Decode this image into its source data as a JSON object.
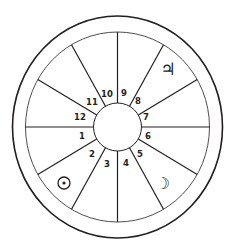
{
  "diagram": {
    "type": "astrological-house-wheel",
    "house_count": 12,
    "colors": {
      "stroke": "#231f20",
      "background": "#ffffff"
    },
    "houses": [
      {
        "number": "1",
        "label": "1"
      },
      {
        "number": "2",
        "label": "2"
      },
      {
        "number": "3",
        "label": "3"
      },
      {
        "number": "4",
        "label": "4"
      },
      {
        "number": "5",
        "label": "5"
      },
      {
        "number": "6",
        "label": "6"
      },
      {
        "number": "7",
        "label": "7"
      },
      {
        "number": "8",
        "label": "8"
      },
      {
        "number": "9",
        "label": "9"
      },
      {
        "number": "10",
        "label": "10"
      },
      {
        "number": "11",
        "label": "11"
      },
      {
        "number": "12",
        "label": "12"
      }
    ],
    "planets": [
      {
        "name": "Jupiter",
        "icon": "jupiter-icon",
        "glyph": "♃",
        "house": "8"
      },
      {
        "name": "Sun",
        "icon": "sun-icon",
        "glyph": "☉",
        "house": "2"
      },
      {
        "name": "Moon",
        "icon": "moon-icon",
        "glyph": "☽",
        "house": "5"
      }
    ]
  }
}
